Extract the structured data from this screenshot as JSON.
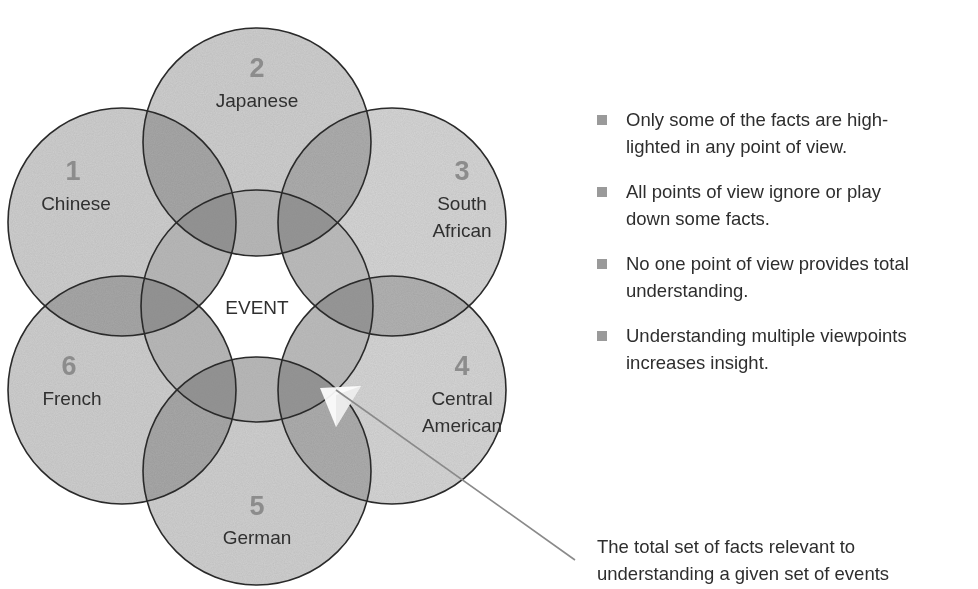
{
  "diagram": {
    "center_label": "EVENT",
    "viewpoints": [
      {
        "number": "1",
        "name_lines": [
          "Chinese"
        ]
      },
      {
        "number": "2",
        "name_lines": [
          "Japanese"
        ]
      },
      {
        "number": "3",
        "name_lines": [
          "South",
          "African"
        ]
      },
      {
        "number": "4",
        "name_lines": [
          "Central",
          "American"
        ]
      },
      {
        "number": "5",
        "name_lines": [
          "German"
        ]
      },
      {
        "number": "6",
        "name_lines": [
          "French"
        ]
      }
    ],
    "colors": {
      "circle_fill": "#c4c4c4",
      "circle_stroke": "#2a2a2a",
      "number_color": "#8c8c8c",
      "label_color": "#303030",
      "pointer_line": "#8a8a8a"
    }
  },
  "bullets": [
    {
      "lines": [
        "Only some of the facts are high-",
        "lighted in any point of view."
      ]
    },
    {
      "lines": [
        "All points of view ignore or play",
        "down some facts."
      ]
    },
    {
      "lines": [
        "No one point of view provides total",
        "understanding."
      ]
    },
    {
      "lines": [
        "Understanding multiple viewpoints",
        "increases insight."
      ]
    }
  ],
  "callout": {
    "lines": [
      "The total set of facts relevant to",
      "understanding a given set of events"
    ]
  }
}
